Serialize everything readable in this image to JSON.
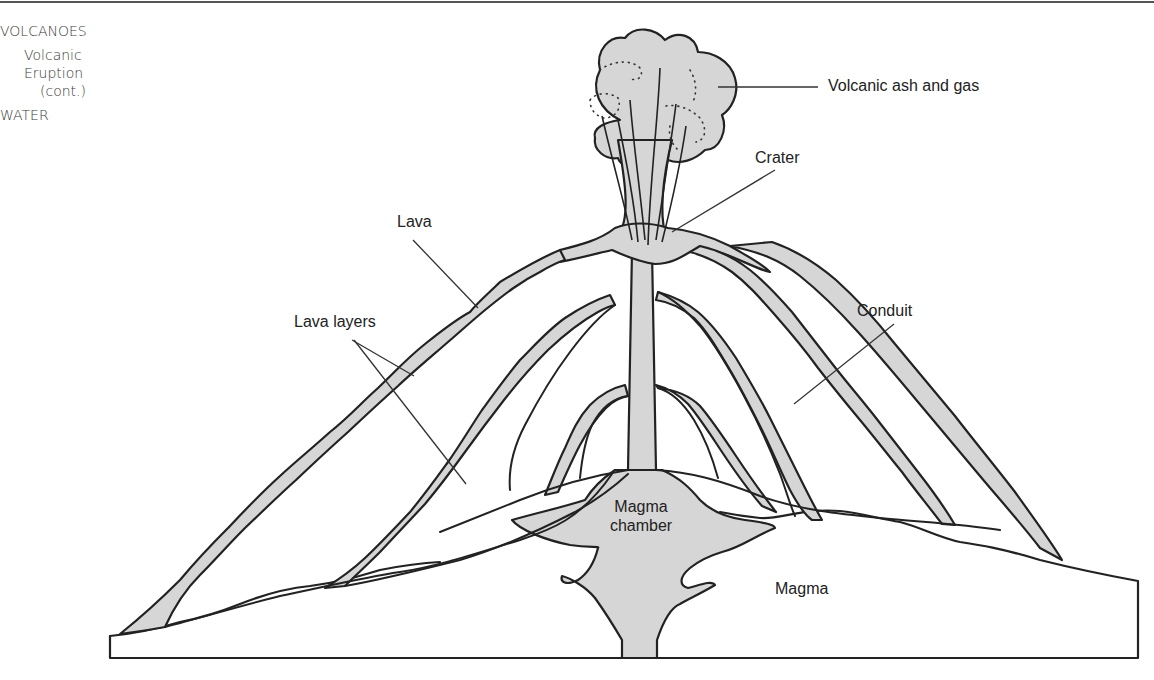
{
  "sidebar": {
    "category": "VOLCANOES",
    "subsection": "Volcanic Eruption",
    "subsection_note": "(cont.)",
    "next_category": "WATER"
  },
  "diagram": {
    "labels": {
      "ash_gas": "Volcanic ash and gas",
      "crater": "Crater",
      "lava": "Lava",
      "lava_layers": "Lava layers",
      "conduit": "Conduit",
      "magma_chamber_line1": "Magma",
      "magma_chamber_line2": "chamber",
      "magma": "Magma"
    },
    "colors": {
      "fill": "#d6d6d6",
      "stroke": "#222222",
      "leader": "#333333"
    }
  }
}
